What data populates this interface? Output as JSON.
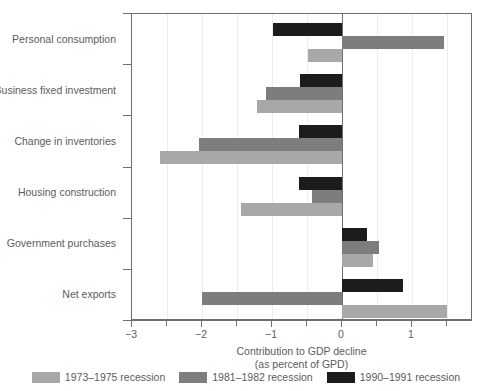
{
  "chart_data": {
    "type": "bar",
    "orientation": "horizontal",
    "title": "",
    "xlabel_line1": "Contribution to GDP decline",
    "xlabel_line2": "(as percent of GPD)",
    "ylabel": "",
    "xlim": [
      -3.3,
      1.55
    ],
    "xticks": [
      -3,
      -2.5,
      -2,
      -1.5,
      -1,
      -0.5,
      0,
      0.5,
      1,
      1.5
    ],
    "xtick_labels": [
      "−3",
      "",
      "−2",
      "",
      "−1",
      "",
      "0",
      "",
      "1",
      ""
    ],
    "grid": "vertical-light",
    "legend_position": "bottom",
    "categories": [
      "Personal consumption",
      "Business fixed investment",
      "Change in inventories",
      "Housing construction",
      "Government purchases",
      "Net exports"
    ],
    "series": [
      {
        "name": "1973–1975 recession",
        "color": "#a8a8a8",
        "values": [
          -0.48,
          -1.22,
          -2.6,
          -1.44,
          0.44,
          1.5
        ]
      },
      {
        "name": "1981–1982 recession",
        "color": "#7d7d7d",
        "values": [
          1.46,
          -1.09,
          -2.04,
          -0.43,
          0.53,
          -2.0
        ]
      },
      {
        "name": "1990–1991 recession",
        "color": "#1c1c1c",
        "values": [
          -0.99,
          -0.6,
          -0.61,
          -0.61,
          0.36,
          0.87
        ]
      }
    ]
  },
  "colors": {
    "series_1973": "#a8a8a8",
    "series_1981": "#7d7d7d",
    "series_1990": "#1c1c1c",
    "axis": "#6f6f6f",
    "grid": "#ededed",
    "text": "#5c5c5c",
    "background": "#ffffff"
  }
}
